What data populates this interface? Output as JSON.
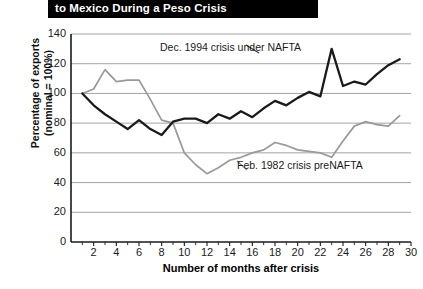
{
  "title": "to Mexico During a Peso Crisis",
  "axes": {
    "y_title": "Percentage of exports\n(nominal = 100%)",
    "x_title": "Number of months after crisis"
  },
  "annotations": {
    "nafta": "Dec. 1994 crisis under NAFTA",
    "prenafta": "Feb. 1982 crisis preNAFTA"
  },
  "colors": {
    "series_nafta": "#1a1a1a",
    "series_prenafta": "#999999",
    "grid": "#9a9a9a",
    "axis": "#1a1a1a",
    "banner_bg": "#000000",
    "banner_text": "#ffffff"
  },
  "chart_data": {
    "type": "line",
    "title": "to Mexico During a Peso Crisis",
    "xlabel": "Number of months after crisis",
    "ylabel": "Percentage of exports (nominal = 100%)",
    "xlim": [
      0,
      30
    ],
    "ylim": [
      0,
      140
    ],
    "ytick_labels": [
      "0",
      "20",
      "40",
      "60",
      "80",
      "100",
      "120",
      "140"
    ],
    "yticks": [
      0,
      20,
      40,
      60,
      80,
      100,
      120,
      140
    ],
    "xtick_labels": [
      "2",
      "4",
      "6",
      "8",
      "10",
      "12",
      "14",
      "16",
      "18",
      "20",
      "22",
      "24",
      "26",
      "28",
      "30"
    ],
    "xticks": [
      2,
      4,
      6,
      8,
      10,
      12,
      14,
      16,
      18,
      20,
      22,
      24,
      26,
      28,
      30
    ],
    "xticks_minor": [
      1,
      3,
      5,
      7,
      9,
      11,
      13,
      15,
      17,
      19,
      21,
      23,
      25,
      27,
      29
    ],
    "grid": "horizontal",
    "legend": "annotations",
    "x": [
      1,
      2,
      3,
      4,
      5,
      6,
      7,
      8,
      9,
      10,
      11,
      12,
      13,
      14,
      15,
      16,
      17,
      18,
      19,
      20,
      21,
      22,
      23,
      24,
      25,
      26,
      27,
      28,
      29
    ],
    "series": [
      {
        "name": "Dec. 1994 crisis under NAFTA",
        "color": "#1a1a1a",
        "values": [
          100,
          92,
          86,
          81,
          76,
          82,
          76,
          72,
          81,
          83,
          83,
          80,
          86,
          83,
          88,
          84,
          90,
          95,
          92,
          97,
          101,
          98,
          130,
          105,
          108,
          106,
          113,
          119,
          123
        ]
      },
      {
        "name": "Feb. 1982 crisis preNAFTA",
        "color": "#999999",
        "values": [
          100,
          103,
          116,
          108,
          109,
          109,
          96,
          82,
          80,
          60,
          52,
          46,
          50,
          55,
          57,
          60,
          62,
          67,
          65,
          62,
          61,
          60,
          57,
          68,
          78,
          81,
          79,
          78,
          85
        ]
      }
    ]
  }
}
